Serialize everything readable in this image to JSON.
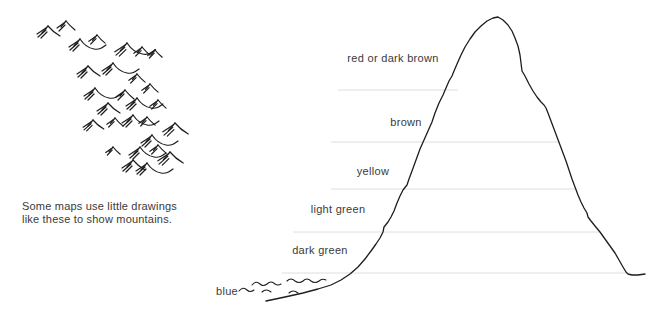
{
  "colors": {
    "ink": "#1d1d1d",
    "band_line": "#dedede",
    "text": "#3a3a3a",
    "background": "#ffffff"
  },
  "figure_left": {
    "caption_line1": "Some maps use little drawings",
    "caption_line2": "like these to show mountains.",
    "symbol_variants": [
      [
        "M0 0 L-6 7",
        "M0 0 Q5 6 12 10",
        "M-2 2 L-11 8",
        "M-2 4 L-10 11",
        "M-1 6 L-7 12"
      ],
      [
        "M0 0 L-6 7",
        "M0 0 C4 6 8 9 14 10 C19 11 22 9 26 6",
        "M-2 2 L-11 8",
        "M-2 4 L-10 11",
        "M-1 6 L-7 12"
      ],
      [
        "M0 0 L-5 6",
        "M0 0 Q4 5 9 9",
        "M-2 2 L-9 7",
        "M-1 4 L-7 10"
      ]
    ],
    "symbols": [
      {
        "x": 48,
        "y": 26,
        "s": 1.0,
        "v": 0
      },
      {
        "x": 66,
        "y": 21,
        "s": 1.0,
        "v": 2
      },
      {
        "x": 80,
        "y": 39,
        "s": 1.0,
        "v": 1
      },
      {
        "x": 97,
        "y": 35,
        "s": 0.9,
        "v": 2
      },
      {
        "x": 127,
        "y": 43,
        "s": 1.1,
        "v": 1
      },
      {
        "x": 142,
        "y": 47,
        "s": 0.9,
        "v": 2
      },
      {
        "x": 155,
        "y": 50,
        "s": 0.8,
        "v": 2
      },
      {
        "x": 88,
        "y": 66,
        "s": 1.0,
        "v": 0
      },
      {
        "x": 113,
        "y": 63,
        "s": 1.0,
        "v": 1
      },
      {
        "x": 137,
        "y": 74,
        "s": 0.9,
        "v": 2
      },
      {
        "x": 95,
        "y": 88,
        "s": 1.0,
        "v": 1
      },
      {
        "x": 125,
        "y": 90,
        "s": 1.0,
        "v": 2
      },
      {
        "x": 150,
        "y": 84,
        "s": 0.9,
        "v": 2
      },
      {
        "x": 108,
        "y": 103,
        "s": 1.0,
        "v": 0
      },
      {
        "x": 137,
        "y": 98,
        "s": 1.0,
        "v": 1
      },
      {
        "x": 158,
        "y": 100,
        "s": 0.9,
        "v": 2
      },
      {
        "x": 93,
        "y": 120,
        "s": 0.9,
        "v": 0
      },
      {
        "x": 115,
        "y": 118,
        "s": 0.9,
        "v": 2
      },
      {
        "x": 133,
        "y": 115,
        "s": 1.0,
        "v": 1
      },
      {
        "x": 147,
        "y": 117,
        "s": 0.9,
        "v": 2
      },
      {
        "x": 175,
        "y": 123,
        "s": 1.1,
        "v": 0
      },
      {
        "x": 152,
        "y": 135,
        "s": 1.0,
        "v": 1
      },
      {
        "x": 113,
        "y": 147,
        "s": 0.8,
        "v": 2
      },
      {
        "x": 140,
        "y": 147,
        "s": 1.0,
        "v": 1
      },
      {
        "x": 158,
        "y": 145,
        "s": 0.9,
        "v": 2
      },
      {
        "x": 170,
        "y": 152,
        "s": 1.1,
        "v": 0
      },
      {
        "x": 133,
        "y": 160,
        "s": 1.0,
        "v": 0
      },
      {
        "x": 147,
        "y": 163,
        "s": 1.0,
        "v": 1
      }
    ]
  },
  "figure_right": {
    "labels": [
      {
        "text": "red or dark brown"
      },
      {
        "text": "brown"
      },
      {
        "text": "yellow"
      },
      {
        "text": "light green"
      },
      {
        "text": "dark green"
      },
      {
        "text": "blue"
      }
    ],
    "band_lines": [
      {
        "y": 90,
        "x1": 338,
        "x2": 458
      },
      {
        "y": 142,
        "x1": 331,
        "x2": 560
      },
      {
        "y": 189,
        "x1": 331,
        "x2": 577
      },
      {
        "y": 232,
        "x1": 293,
        "x2": 600
      },
      {
        "y": 273,
        "x1": 282,
        "x2": 626
      }
    ],
    "outline": [
      [
        266,
        301
      ],
      [
        285,
        297
      ],
      [
        303,
        293
      ],
      [
        318,
        289
      ],
      [
        331,
        285
      ],
      [
        341,
        280
      ],
      [
        350,
        274
      ],
      [
        358,
        267
      ],
      [
        365,
        259
      ],
      [
        371,
        251
      ],
      [
        376,
        244
      ],
      [
        380,
        238
      ],
      [
        383,
        232
      ],
      [
        384,
        227
      ],
      [
        388,
        222
      ],
      [
        391,
        217
      ],
      [
        394,
        211
      ],
      [
        397,
        203
      ],
      [
        400,
        196
      ],
      [
        403,
        190
      ],
      [
        407,
        185
      ],
      [
        409,
        179
      ],
      [
        412,
        171
      ],
      [
        416,
        160
      ],
      [
        420,
        149
      ],
      [
        424,
        140
      ],
      [
        428,
        131
      ],
      [
        432,
        122
      ],
      [
        435,
        113
      ],
      [
        439,
        103
      ],
      [
        443,
        95
      ],
      [
        446,
        88
      ],
      [
        449,
        81
      ],
      [
        452,
        76
      ],
      [
        454,
        71
      ],
      [
        457,
        64
      ],
      [
        461,
        55
      ],
      [
        465,
        47
      ],
      [
        470,
        39
      ],
      [
        475,
        32
      ],
      [
        481,
        26
      ],
      [
        487,
        21
      ],
      [
        493,
        18
      ],
      [
        498,
        17
      ],
      [
        503,
        20
      ],
      [
        508,
        25
      ],
      [
        512,
        31
      ],
      [
        515,
        38
      ],
      [
        518,
        46
      ],
      [
        520,
        55
      ],
      [
        521,
        63
      ],
      [
        522,
        71
      ],
      [
        525,
        76
      ],
      [
        529,
        84
      ],
      [
        533,
        91
      ],
      [
        537,
        97
      ],
      [
        541,
        102
      ],
      [
        544,
        105
      ],
      [
        546,
        108
      ],
      [
        548,
        113
      ],
      [
        551,
        121
      ],
      [
        554,
        129
      ],
      [
        557,
        137
      ],
      [
        560,
        145
      ],
      [
        563,
        153
      ],
      [
        566,
        161
      ],
      [
        569,
        170
      ],
      [
        572,
        179
      ],
      [
        575,
        187
      ],
      [
        578,
        195
      ],
      [
        581,
        202
      ],
      [
        584,
        208
      ],
      [
        587,
        213
      ],
      [
        588,
        217
      ],
      [
        591,
        221
      ],
      [
        595,
        226
      ],
      [
        600,
        232
      ],
      [
        605,
        239
      ],
      [
        610,
        246
      ],
      [
        615,
        253
      ],
      [
        619,
        260
      ],
      [
        623,
        267
      ],
      [
        626,
        272
      ],
      [
        628,
        274
      ],
      [
        632,
        275
      ],
      [
        638,
        275
      ],
      [
        645,
        274
      ]
    ],
    "water_paths": [
      "M252 285 q4 -5 8 -1 q3 3 7 0 q4 -4 8 0 q3 2 6 0",
      "M287 281 q4 -4 8 0 q4 3 8 0 q4 -4 8 0 q4 3 8 0 q3 -3 7 -1",
      "M239 291 q4 -5 8 -1 q3 3 7 0",
      "M262 292 q4 -4 9 0",
      "M289 293 q4 -4 9 0"
    ]
  }
}
